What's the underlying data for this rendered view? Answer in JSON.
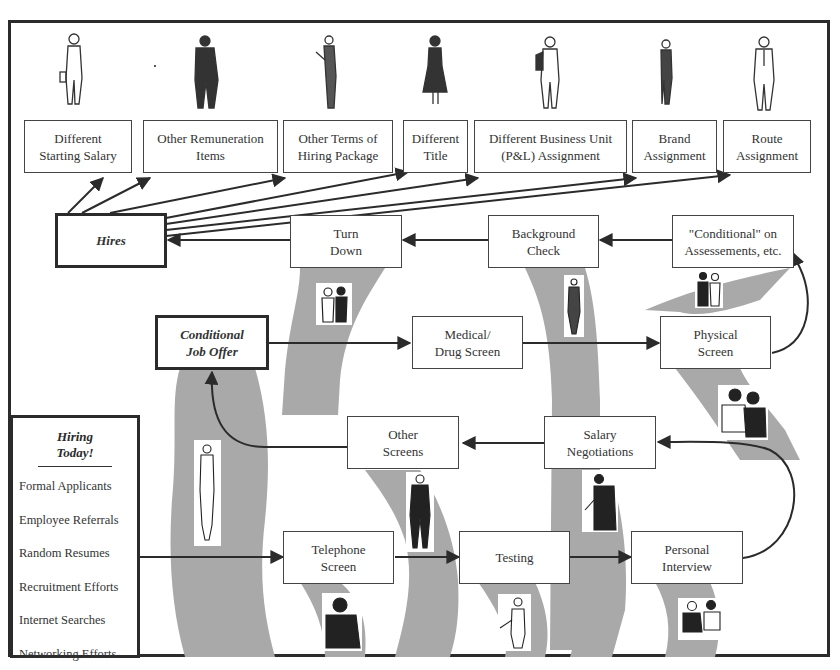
{
  "diagram": {
    "type": "flowchart",
    "title": "",
    "colors": {
      "ribbon": "#a9a9a9",
      "line": "#2b2b2b",
      "box_border": "#444444",
      "text": "#333333"
    },
    "outcomes": [
      {
        "id": "different_starting_salary",
        "label": "Different\nStarting Salary",
        "figure": "person-with-briefcase-icon"
      },
      {
        "id": "other_remuneration_items",
        "label": "Other Remuneration\nItems",
        "figure": "man-in-suit-icon"
      },
      {
        "id": "other_terms_hiring_package",
        "label": "Other Terms of\nHiring Package",
        "figure": "person-reading-icon"
      },
      {
        "id": "different_title",
        "label": "Different\nTitle",
        "figure": "woman-in-skirt-icon"
      },
      {
        "id": "different_business_unit",
        "label": "Different Business Unit\n(P&L) Assignment",
        "figure": "man-with-jacket-icon"
      },
      {
        "id": "brand_assignment",
        "label": "Brand\nAssignment",
        "figure": "woman-walking-icon"
      },
      {
        "id": "route_assignment",
        "label": "Route\nAssignment",
        "figure": "man-with-tie-icon"
      }
    ],
    "nodes": {
      "hires": "Hires",
      "turn_down": "Turn\nDown",
      "background_check": "Background\nCheck",
      "conditional_on_assessments": "\"Conditional\" on\nAssessements, etc.",
      "conditional_job_offer": "Conditional\nJob Offer",
      "medical_drug_screen": "Medical/\nDrug Screen",
      "physical_screen": "Physical\nScreen",
      "other_screens": "Other\nScreens",
      "salary_negotiations": "Salary\nNegotiations",
      "telephone_screen": "Telephone\nScreen",
      "testing": "Testing",
      "personal_interview": "Personal\nInterview"
    },
    "edges": [
      [
        "hiring_today",
        "telephone_screen"
      ],
      [
        "telephone_screen",
        "testing"
      ],
      [
        "testing",
        "personal_interview"
      ],
      [
        "personal_interview",
        "salary_negotiations"
      ],
      [
        "salary_negotiations",
        "other_screens"
      ],
      [
        "other_screens",
        "conditional_job_offer"
      ],
      [
        "conditional_job_offer",
        "medical_drug_screen"
      ],
      [
        "medical_drug_screen",
        "physical_screen"
      ],
      [
        "physical_screen",
        "conditional_on_assessments"
      ],
      [
        "conditional_on_assessments",
        "background_check"
      ],
      [
        "background_check",
        "turn_down"
      ],
      [
        "turn_down",
        "hires"
      ],
      [
        "hires",
        "different_starting_salary"
      ],
      [
        "hires",
        "other_remuneration_items"
      ],
      [
        "hires",
        "other_terms_hiring_package"
      ],
      [
        "hires",
        "different_title"
      ],
      [
        "hires",
        "different_business_unit"
      ],
      [
        "hires",
        "brand_assignment"
      ],
      [
        "hires",
        "route_assignment"
      ]
    ],
    "legend": {
      "title": "Hiring\nToday!",
      "items": [
        "Formal Applicants",
        "Employee Referrals",
        "Random Resumes",
        "Recruitment Efforts",
        "Internet Searches",
        "Networking Efforts"
      ]
    },
    "clipart": [
      "two-people-talking-icon",
      "woman-in-hat-icon",
      "couple-icon",
      "group-meeting-icon",
      "woman-in-dress-icon",
      "standing-man-icon",
      "man-with-microphone-icon",
      "man-on-phone-icon",
      "child-pointing-icon",
      "interview-pair-icon"
    ]
  }
}
